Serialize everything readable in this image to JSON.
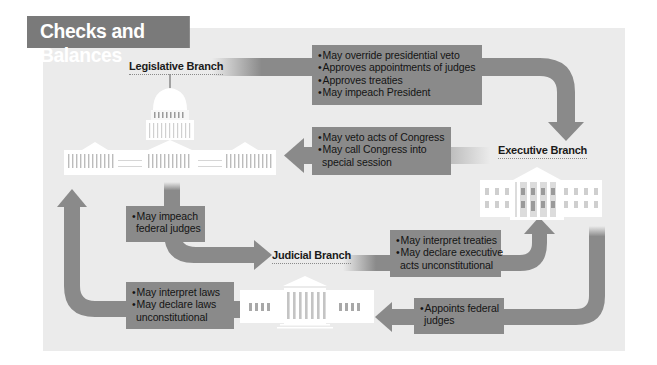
{
  "title": "Checks and Balances",
  "colors": {
    "title_bar": "#7a7a7a",
    "panel_bg": "#ebebeb",
    "box_fill": "#8a8a8a",
    "arrow_fill": "#8a8a8a",
    "building_fill": "#ffffff",
    "text": "#141414"
  },
  "branches": {
    "legislative": {
      "label": "Legislative Branch",
      "icon": "capitol-building-icon"
    },
    "executive": {
      "label": "Executive Branch",
      "icon": "white-house-icon"
    },
    "judicial": {
      "label": "Judicial Branch",
      "icon": "supreme-court-icon"
    }
  },
  "checks": {
    "legislative_on_executive": {
      "from": "Legislative Branch",
      "to": "Executive Branch",
      "items": [
        "May override presidential veto",
        "Approves appointments of judges",
        "Approves treaties",
        "May impeach President"
      ]
    },
    "executive_on_legislative": {
      "from": "Executive Branch",
      "to": "Legislative Branch",
      "items": [
        "May veto acts of Congress",
        "May call Congress into",
        "special session"
      ]
    },
    "legislative_on_judicial": {
      "from": "Legislative Branch",
      "to": "Judicial Branch",
      "items": [
        "May impeach",
        "federal judges"
      ]
    },
    "judicial_on_executive": {
      "from": "Judicial Branch",
      "to": "Executive Branch",
      "items": [
        "May interpret treaties",
        "May declare executive",
        "acts unconstitutional"
      ]
    },
    "judicial_on_legislative": {
      "from": "Judicial Branch",
      "to": "Legislative Branch",
      "items": [
        "May interpret laws",
        "May declare laws",
        "unconstitutional"
      ]
    },
    "executive_on_judicial": {
      "from": "Executive Branch",
      "to": "Judicial Branch",
      "items": [
        "Appoints federal",
        "judges"
      ]
    }
  }
}
